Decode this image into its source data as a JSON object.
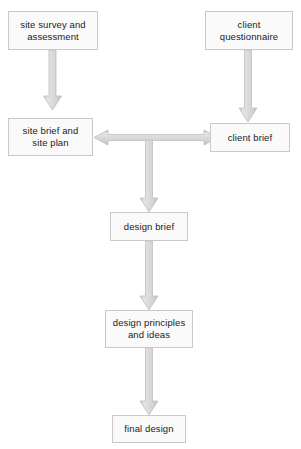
{
  "diagram": {
    "canvas": {
      "width": 301,
      "height": 449,
      "background": "#ffffff"
    },
    "style": {
      "node_fill": "#fafafa",
      "node_border": "#c9c9c9",
      "arrow_fill": "#dcdcdc",
      "arrow_border": "#c2c2c2",
      "text_color": "#1a1a1a"
    },
    "nodes": [
      {
        "id": "site-survey",
        "label": "site survey and\nassessment",
        "x": 8,
        "y": 11,
        "w": 90,
        "h": 39
      },
      {
        "id": "client-questionnaire",
        "label": "client\nquestionnaire",
        "x": 205,
        "y": 11,
        "w": 88,
        "h": 39
      },
      {
        "id": "site-brief",
        "label": "site brief and\nsite plan",
        "x": 8,
        "y": 118,
        "w": 85,
        "h": 38
      },
      {
        "id": "client-brief",
        "label": "client brief",
        "x": 210,
        "y": 123,
        "w": 80,
        "h": 29
      },
      {
        "id": "design-brief",
        "label": "design brief",
        "x": 110,
        "y": 212,
        "w": 78,
        "h": 29
      },
      {
        "id": "design-principles",
        "label": "design principles\nand ideas",
        "x": 105,
        "y": 310,
        "w": 88,
        "h": 38
      },
      {
        "id": "final-design",
        "label": "final design",
        "x": 112,
        "y": 415,
        "w": 74,
        "h": 28
      }
    ],
    "arrows": [
      {
        "id": "survey-to-site-brief",
        "from": "site-survey",
        "to": "site-brief",
        "direction": "down"
      },
      {
        "id": "questionnaire-to-client-brief",
        "from": "client-questionnaire",
        "to": "client-brief",
        "direction": "down"
      },
      {
        "id": "site-brief-client-brief",
        "from": "site-brief",
        "to": "client-brief",
        "direction": "both-horizontal"
      },
      {
        "id": "junction-to-design-brief",
        "from": "site-brief-client-brief",
        "to": "design-brief",
        "direction": "down"
      },
      {
        "id": "design-brief-to-principles",
        "from": "design-brief",
        "to": "design-principles",
        "direction": "down"
      },
      {
        "id": "principles-to-final",
        "from": "design-principles",
        "to": "final-design",
        "direction": "down"
      }
    ]
  }
}
